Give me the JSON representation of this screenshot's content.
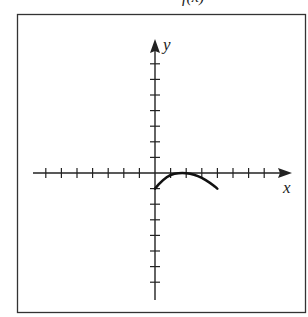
{
  "header": {
    "clipped_text_fragment": "f(x)"
  },
  "chart_data": {
    "type": "line",
    "title": "",
    "xlabel": "x",
    "ylabel": "y",
    "xlim": [
      -8,
      8
    ],
    "ylim": [
      -8,
      8
    ],
    "grid": false,
    "tick_spacing": 1,
    "x_ticks": [
      -7,
      -6,
      -5,
      -4,
      -3,
      -2,
      -1,
      1,
      2,
      3,
      4,
      5,
      6,
      7
    ],
    "y_ticks": [
      -7,
      -6,
      -5,
      -4,
      -3,
      -2,
      -1,
      1,
      2,
      3,
      4,
      5,
      6,
      7
    ],
    "series": [
      {
        "name": "curve",
        "x": [
          0,
          0.5,
          1,
          1.5,
          2,
          2.5,
          3,
          3.5,
          4
        ],
        "y": [
          -1,
          -0.44,
          -0.1,
          0,
          0,
          -0.1,
          -0.3,
          -0.6,
          -1
        ]
      }
    ],
    "colors": {
      "axis": "#222222",
      "curve": "#111111",
      "frame": "#333333"
    }
  }
}
